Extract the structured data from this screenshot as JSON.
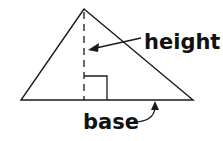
{
  "diagram": {
    "type": "triangle-area-labels",
    "labels": {
      "height": "height",
      "base": "base"
    },
    "colors": {
      "stroke": "#1a1a1a",
      "background": "#ffffff"
    }
  }
}
